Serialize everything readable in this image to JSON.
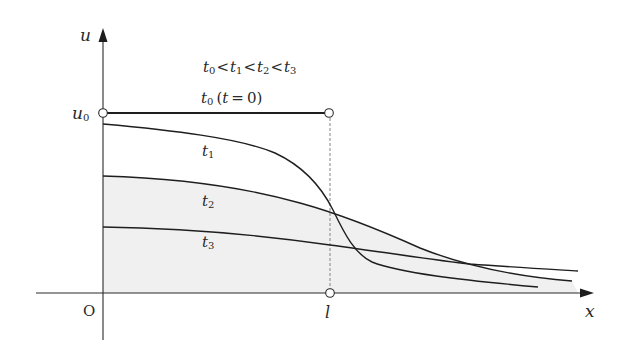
{
  "diagram": {
    "type": "diffusion-profile",
    "colors": {
      "line": "#1e1e1e",
      "axis": "#2a2a2a",
      "dashed": "#777777",
      "shade": "#f0f0f0",
      "circle_fill": "#ffffff"
    },
    "axes": {
      "x_label": "x",
      "y_label": "u",
      "origin_label": "O",
      "l_label": "l",
      "u0_label": "u",
      "u0_sub": "0"
    },
    "legend": {
      "ordering": {
        "parts": [
          {
            "base": "t",
            "sub": "0"
          },
          {
            "op": "<"
          },
          {
            "base": "t",
            "sub": "1"
          },
          {
            "op": "<"
          },
          {
            "base": "t",
            "sub": "2"
          },
          {
            "op": "<"
          },
          {
            "base": "t",
            "sub": "3"
          }
        ]
      },
      "initial": {
        "base": "t",
        "sub": "0",
        "paren": "(t = 0)",
        "paren_open": "(",
        "paren_var": "t",
        "paren_eq": "=",
        "paren_val": "0",
        "paren_close": ")"
      }
    },
    "curves": [
      {
        "name": "t0",
        "label_base": "t",
        "label_sub": "0",
        "desc": "step profile u = u0 for 0<x<l"
      },
      {
        "name": "t1",
        "label_base": "t",
        "label_sub": "1"
      },
      {
        "name": "t2",
        "label_base": "t",
        "label_sub": "2"
      },
      {
        "name": "t3",
        "label_base": "t",
        "label_sub": "3"
      }
    ]
  }
}
